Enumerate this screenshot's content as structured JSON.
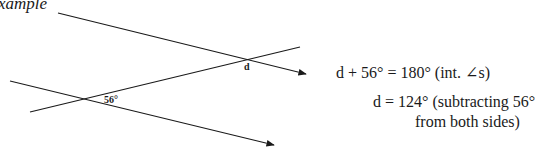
{
  "heading": "xample",
  "diagram": {
    "angle_labels": {
      "d": "d",
      "given": "56°"
    },
    "lines": [
      {
        "name": "upper-parallel-line",
        "x1": 58,
        "y1": 13,
        "x2": 308,
        "y2": 75,
        "arrow": true
      },
      {
        "name": "transversal-line",
        "x1": 30,
        "y1": 112,
        "x2": 300,
        "y2": 47,
        "arrow": false
      },
      {
        "name": "lower-parallel-line",
        "x1": 10,
        "y1": 81,
        "x2": 276,
        "y2": 146,
        "arrow": true
      }
    ]
  },
  "working": {
    "line1": "d + 56° = 180°  (int. ∠s)",
    "line2": "d = 124°  (subtracting 56°",
    "line3": "from both sides)"
  }
}
